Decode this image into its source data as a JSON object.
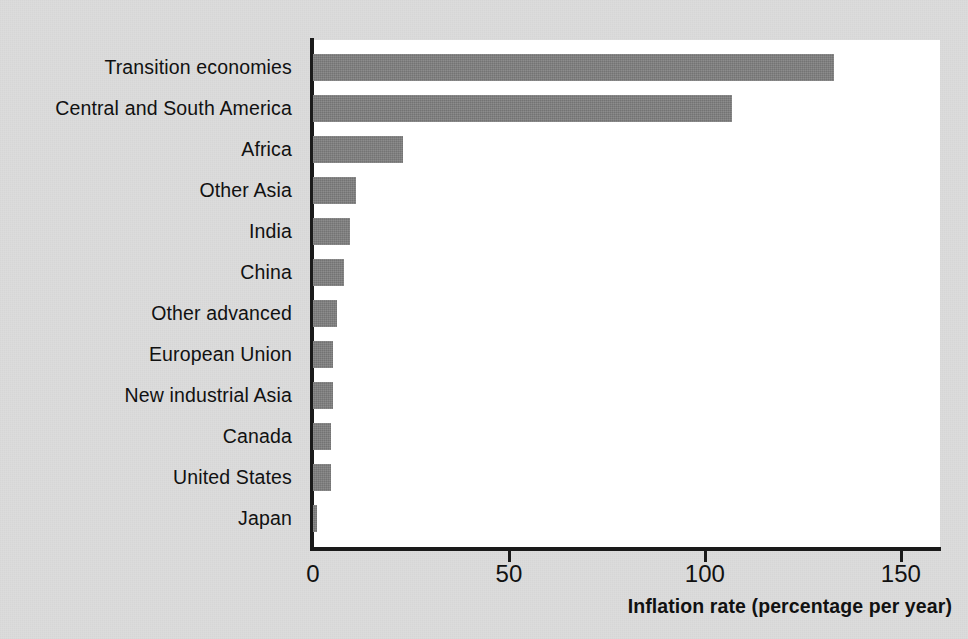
{
  "chart_data": {
    "type": "bar",
    "orientation": "horizontal",
    "title": "",
    "subtitle": "",
    "xlabel": "Inflation rate (percentage per year)",
    "ylabel": "",
    "xlim": [
      0,
      160
    ],
    "x_ticks": [
      0,
      50,
      100,
      150
    ],
    "x_tick_labels": [
      "0",
      "50",
      "100",
      "150"
    ],
    "grid": false,
    "legend": null,
    "bar_color": "#808080",
    "plot_background": "#ffffff",
    "page_background": "#dcdcdc",
    "axis_color": "#1a1a1a",
    "categories": [
      "Transition economies",
      "Central and South America",
      "Africa",
      "Other Asia",
      "India",
      "China",
      "Other advanced",
      "European Union",
      "New industrial Asia",
      "Canada",
      "United States",
      "Japan"
    ],
    "values": [
      133,
      107,
      23,
      11,
      9.5,
      8,
      6,
      5,
      5,
      4.5,
      4.5,
      1
    ]
  },
  "axis": {
    "x_title": "Inflation rate (percentage per year)",
    "ticks": [
      {
        "label": "0",
        "value": 0
      },
      {
        "label": "50",
        "value": 50
      },
      {
        "label": "100",
        "value": 100
      },
      {
        "label": "150",
        "value": 150
      }
    ]
  }
}
